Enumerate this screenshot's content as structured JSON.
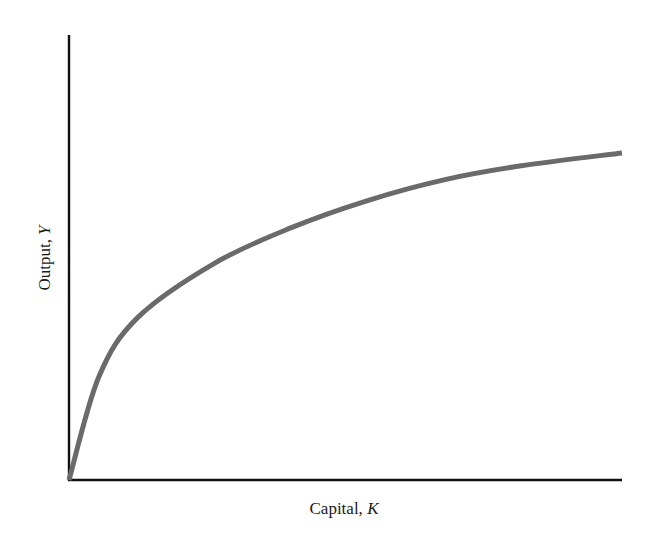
{
  "chart_data": {
    "type": "line",
    "title": "",
    "xlabel": "Capital, K",
    "ylabel": "Output, Y",
    "xlabel_parts": {
      "text": "Capital, ",
      "var": "K"
    },
    "ylabel_parts": {
      "text": "Output, ",
      "var": "Y"
    },
    "grid": false,
    "legend": null,
    "ticks": {
      "x": [],
      "y": []
    },
    "xlim": [
      0,
      1
    ],
    "ylim": [
      0,
      1
    ],
    "series": [
      {
        "name": "Production function",
        "color": "#6a6a6a",
        "shape": "concave, increasing at a diminishing rate",
        "x": [
          0.0,
          0.054,
          0.125,
          0.263,
          0.402,
          0.54,
          0.68,
          0.818,
          1.0
        ],
        "y": [
          0.0,
          0.232,
          0.366,
          0.487,
          0.567,
          0.628,
          0.675,
          0.706,
          0.735
        ]
      }
    ]
  },
  "labels": {
    "x_axis": "Capital, K",
    "y_axis": "Output, Y"
  },
  "colors": {
    "axis": "#111111",
    "curve": "#6a6a6a",
    "text": "#1a1a1a",
    "background": "#ffffff"
  }
}
